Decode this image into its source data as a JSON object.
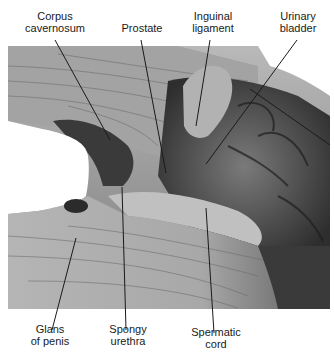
{
  "figure": {
    "background_color": "#ffffff",
    "line_color": "#1a1a1a",
    "labels": {
      "corpus_cavernosum": "Corpus\ncavernosum",
      "prostate": "Prostate",
      "inguinal_ligament": "Inguinal\nligament",
      "urinary_bladder": "Urinary\nbladder",
      "glans_of_penis": "Glans\nof penis",
      "spongy_urethra": "Spongy\nurethra",
      "spermatic_cord": "Spermatic\ncord"
    }
  }
}
